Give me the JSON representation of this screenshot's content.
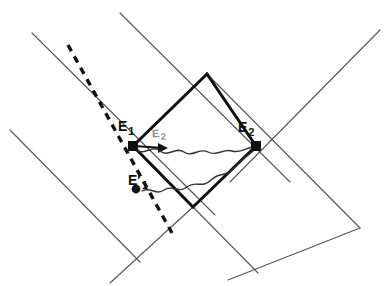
{
  "figure": {
    "kind": "spacetime-diagram",
    "width": 391,
    "height": 286,
    "background_color": "#ffffff",
    "line_color": "#1a1a1a",
    "thin_line_color": "#555555",
    "faint_label_color": "#8f8f8f"
  },
  "labels": {
    "e1": {
      "base": "E",
      "sub": "1",
      "prime": ""
    },
    "e2": {
      "base": "E",
      "sub": "2",
      "prime": ""
    },
    "e1_prime": {
      "base": "E",
      "sub": "1",
      "prime": "′"
    },
    "e2_faint": {
      "base": "E",
      "sub": "2",
      "prime": ""
    }
  },
  "events": [
    {
      "name": "E1",
      "x": 133,
      "y": 146,
      "marker": "filled-square"
    },
    {
      "name": "E2",
      "x": 256,
      "y": 146,
      "marker": "filled-square"
    },
    {
      "name": "E1-prime",
      "x": 136,
      "y": 189,
      "marker": "filled-circle"
    },
    {
      "name": "arrow-tip",
      "x": 167,
      "y": 148,
      "marker": "arrowhead"
    }
  ],
  "diagram_geometry": {
    "thick_lines": [
      {
        "name": "lightcone-e1-up-right",
        "x1": 133,
        "y1": 146,
        "x2": 207,
        "y2": 74
      },
      {
        "name": "lightcone-e2-up-left",
        "x1": 256,
        "y1": 146,
        "x2": 207,
        "y2": 74
      },
      {
        "name": "lightcone-e1-down-right",
        "x1": 133,
        "y1": 146,
        "x2": 193,
        "y2": 207
      },
      {
        "name": "lightcone-e2-down-left",
        "x1": 256,
        "y1": 146,
        "x2": 193,
        "y2": 207
      }
    ],
    "thin_lines": [
      {
        "name": "grid-nw-1",
        "x1": 32,
        "y1": 33,
        "x2": 215,
        "y2": 215
      },
      {
        "name": "grid-nw-2",
        "x1": 10,
        "y1": 130,
        "x2": 140,
        "y2": 262
      },
      {
        "name": "grid-nw-3",
        "x1": 207,
        "y1": 74,
        "x2": 360,
        "y2": 228
      },
      {
        "name": "grid-nw-4",
        "x1": 193,
        "y1": 207,
        "x2": 258,
        "y2": 273
      },
      {
        "name": "grid-ne-1",
        "x1": 120,
        "y1": 13,
        "x2": 290,
        "y2": 182
      },
      {
        "name": "grid-ne-2",
        "x1": 193,
        "y1": 207,
        "x2": 110,
        "y2": 283
      },
      {
        "name": "grid-ne-3",
        "x1": 380,
        "y1": 30,
        "x2": 230,
        "y2": 182
      },
      {
        "name": "grid-ne-4",
        "x1": 360,
        "y1": 228,
        "x2": 228,
        "y2": 280
      }
    ],
    "dashed_line": {
      "name": "dashed-worldline",
      "x1": 68,
      "y1": 45,
      "x2": 72,
      "y2": 233
    },
    "arrow": {
      "name": "short-arrow",
      "x1": 133,
      "y1": 146,
      "x2": 167,
      "y2": 148
    },
    "wavy_signals": [
      {
        "name": "wavy-signal-upper",
        "from": "arrow-tip",
        "to": "E2"
      },
      {
        "name": "wavy-signal-lower",
        "from": "E1-prime",
        "to": "E2"
      }
    ]
  }
}
